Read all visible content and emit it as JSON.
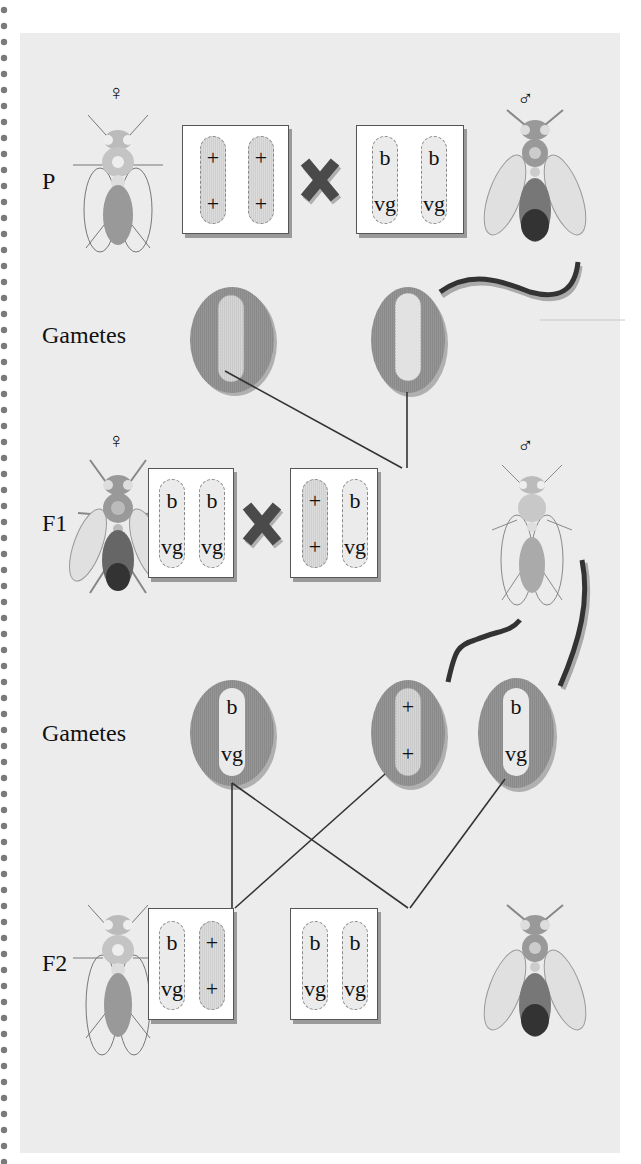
{
  "diagram": {
    "rows": {
      "p": {
        "label": "P"
      },
      "gametes1": {
        "label": "Gametes"
      },
      "f1": {
        "label": "F1"
      },
      "gametes2": {
        "label": "Gametes"
      },
      "f2": {
        "label": "F2"
      }
    },
    "symbols": {
      "female": "♀",
      "male": "♂",
      "cross": "×"
    },
    "genotypes": {
      "p_female": {
        "chrom1": [
          "+",
          "+"
        ],
        "chrom2": [
          "+",
          "+"
        ]
      },
      "p_male": {
        "chrom1": [
          "b",
          "vg"
        ],
        "chrom2": [
          "b",
          "vg"
        ]
      },
      "f1_female": {
        "chrom1": [
          "b",
          "vg"
        ],
        "chrom2": [
          "b",
          "vg"
        ]
      },
      "f1_male": {
        "chrom1": [
          "+",
          "+"
        ],
        "chrom2": [
          "b",
          "vg"
        ]
      },
      "gamete_egg": [
        "b",
        "vg"
      ],
      "gamete_sperm_wt": [
        "+",
        "+"
      ],
      "gamete_sperm_mut": [
        "b",
        "vg"
      ],
      "f2_a": {
        "chrom1": [
          "b",
          "vg"
        ],
        "chrom2": [
          "+",
          "+"
        ]
      },
      "f2_b": {
        "chrom1": [
          "b",
          "vg"
        ],
        "chrom2": [
          "b",
          "vg"
        ]
      }
    },
    "colors": {
      "panel": "#ececec",
      "gamete_fill": "#8f8f8f",
      "wild_chromosome": "#d4d4d4",
      "mutant_chromosome": "#ebebeb",
      "cross_mark": "#4a4a4a",
      "line": "#333333"
    }
  }
}
